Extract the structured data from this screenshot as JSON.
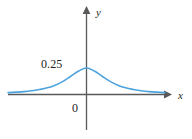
{
  "figure": {
    "name": "bell-curve-density-plot",
    "background_color": "#ffffff"
  },
  "labels": {
    "y_axis": "y",
    "x_axis": "x",
    "peak_value": "0.25",
    "origin": "0"
  },
  "colors": {
    "curve": "#4da3dd",
    "axis": "#58595b",
    "text": "#231f20"
  },
  "chart_data": {
    "type": "line",
    "title": "",
    "xlabel": "x",
    "ylabel": "y",
    "grid": false,
    "legend": null,
    "annotations": [
      "0.25",
      "0"
    ],
    "xlim": [
      -4,
      4
    ],
    "ylim": [
      0,
      0.3
    ],
    "ytick_labels": [
      "0",
      "0.25"
    ],
    "ytick_values": [
      0,
      0.25
    ],
    "xtick_labels": [],
    "series": [
      {
        "name": "density",
        "x": [
          -4,
          -3.6,
          -3.2,
          -2.8,
          -2.4,
          -2,
          -1.6,
          -1.2,
          -0.8,
          -0.4,
          0,
          0.4,
          0.8,
          1.2,
          1.6,
          2,
          2.4,
          2.8,
          3.2,
          3.6,
          4
        ],
        "y": [
          0.018,
          0.022,
          0.027,
          0.035,
          0.047,
          0.063,
          0.088,
          0.124,
          0.172,
          0.221,
          0.25,
          0.221,
          0.172,
          0.124,
          0.088,
          0.063,
          0.047,
          0.035,
          0.027,
          0.022,
          0.018
        ]
      }
    ]
  }
}
